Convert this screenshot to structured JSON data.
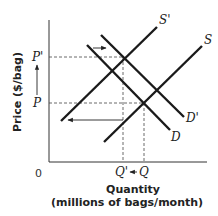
{
  "diagram": {
    "type": "supply-demand",
    "y_axis_label": "Price ($/bag)",
    "x_axis_label_line1": "Quantity",
    "x_axis_label_line2": "(millions of bags/month)",
    "origin_label": "0",
    "price_labels": {
      "p_prime": "P'",
      "p": "P"
    },
    "quantity_labels": {
      "q_prime": "Q'",
      "q": "Q"
    },
    "curves": {
      "s": "S",
      "s_prime": "S'",
      "d": "D",
      "d_prime": "D'"
    },
    "arrows": [
      {
        "name": "demand-shift-arrow",
        "direction": "right"
      },
      {
        "name": "supply-shift-arrow",
        "direction": "left"
      },
      {
        "name": "price-increase-arrow",
        "direction": "up"
      },
      {
        "name": "quantity-decrease-arrow",
        "direction": "left"
      }
    ]
  }
}
